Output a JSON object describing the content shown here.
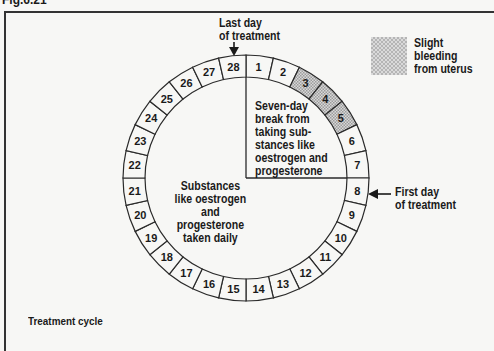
{
  "figure": {
    "label": "Fig.6.21",
    "caption": "Treatment cycle"
  },
  "legend": {
    "swatch_pattern": "hatched-grey",
    "text_lines": [
      "Slight",
      "bleeding",
      "from uterus"
    ]
  },
  "annotations": {
    "last_day": [
      "Last day",
      "of treatment"
    ],
    "first_day": [
      "First day",
      "of treatment"
    ],
    "break_region": [
      "Seven-day",
      "break from",
      "taking sub-",
      "stances like",
      "oestrogen and",
      "progesterone"
    ],
    "daily_region": [
      "Substances",
      "like oestrogen",
      "and",
      "progesterone",
      "taken daily"
    ]
  },
  "cycle": {
    "total_days": 28,
    "days": [
      {
        "n": "1",
        "shaded": false
      },
      {
        "n": "2",
        "shaded": false
      },
      {
        "n": "3",
        "shaded": true
      },
      {
        "n": "4",
        "shaded": true
      },
      {
        "n": "5",
        "shaded": true
      },
      {
        "n": "6",
        "shaded": false
      },
      {
        "n": "7",
        "shaded": false
      },
      {
        "n": "8",
        "shaded": false
      },
      {
        "n": "9",
        "shaded": false
      },
      {
        "n": "10",
        "shaded": false
      },
      {
        "n": "11",
        "shaded": false
      },
      {
        "n": "12",
        "shaded": false
      },
      {
        "n": "13",
        "shaded": false
      },
      {
        "n": "14",
        "shaded": false
      },
      {
        "n": "15",
        "shaded": false
      },
      {
        "n": "16",
        "shaded": false
      },
      {
        "n": "17",
        "shaded": false
      },
      {
        "n": "18",
        "shaded": false
      },
      {
        "n": "19",
        "shaded": false
      },
      {
        "n": "20",
        "shaded": false
      },
      {
        "n": "21",
        "shaded": false
      },
      {
        "n": "22",
        "shaded": false
      },
      {
        "n": "23",
        "shaded": false
      },
      {
        "n": "24",
        "shaded": false
      },
      {
        "n": "25",
        "shaded": false
      },
      {
        "n": "26",
        "shaded": false
      },
      {
        "n": "27",
        "shaded": false
      },
      {
        "n": "28",
        "shaded": false
      }
    ],
    "colors": {
      "line": "#2a2a2a",
      "shade": "#bdbdbd",
      "background": "#f7f7f5"
    }
  }
}
